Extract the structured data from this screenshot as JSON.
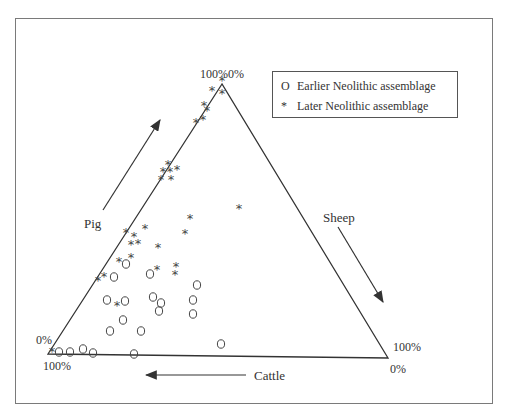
{
  "chart_data": {
    "type": "ternary-scatter",
    "title": "",
    "axes": {
      "pig": {
        "label": "Pig",
        "direction": "up-left edge, arrow toward top vertex",
        "apex_label": "100%",
        "base_label": "0%"
      },
      "sheep": {
        "label": "Sheep",
        "direction": "right edge, arrow toward bottom-right",
        "apex_label": "0%",
        "base_label": "100%"
      },
      "cattle": {
        "label": "Cattle",
        "direction": "bottom edge, arrow toward bottom-left",
        "left_label": "100%",
        "right_label": "0%"
      }
    },
    "corner_labels": {
      "top_left": "100%",
      "top_right": "0%",
      "bottom_left_upper": "0%",
      "bottom_left_lower": "100%",
      "bottom_right_upper": "100%",
      "bottom_right_lower": "0%"
    },
    "legend": [
      {
        "symbol": "O",
        "label": "Earlier Neolithic assemblage"
      },
      {
        "symbol": "*",
        "label": "Later Neolithic assemblage"
      }
    ],
    "series": [
      {
        "name": "Earlier Neolithic assemblage",
        "marker": "O",
        "points_px": [
          [
            59,
            352
          ],
          [
            70,
            352
          ],
          [
            83,
            349
          ],
          [
            93,
            353
          ],
          [
            134,
            354
          ],
          [
            221,
            344
          ],
          [
            114,
            277
          ],
          [
            126,
            264
          ],
          [
            150,
            274
          ],
          [
            197,
            285
          ],
          [
            193,
            300
          ],
          [
            193,
            314
          ],
          [
            107,
            300
          ],
          [
            125,
            301
          ],
          [
            153,
            297
          ],
          [
            161,
            303
          ],
          [
            159,
            311
          ],
          [
            123,
            320
          ],
          [
            110,
            331
          ],
          [
            141,
            331
          ]
        ]
      },
      {
        "name": "Later Neolithic assemblage",
        "marker": "*",
        "points_px": [
          [
            222,
            79
          ],
          [
            212,
            89
          ],
          [
            222,
            92
          ],
          [
            204,
            104
          ],
          [
            207,
            109
          ],
          [
            196,
            121
          ],
          [
            203,
            118
          ],
          [
            168,
            163
          ],
          [
            163,
            170
          ],
          [
            170,
            170
          ],
          [
            177,
            168
          ],
          [
            161,
            178
          ],
          [
            171,
            178
          ],
          [
            239,
            207
          ],
          [
            190,
            217
          ],
          [
            185,
            232
          ],
          [
            145,
            227
          ],
          [
            126,
            231
          ],
          [
            134,
            235
          ],
          [
            131,
            243
          ],
          [
            138,
            242
          ],
          [
            158,
            246
          ],
          [
            119,
            260
          ],
          [
            131,
            256
          ],
          [
            157,
            268
          ],
          [
            176,
            265
          ],
          [
            175,
            273
          ],
          [
            104,
            275
          ],
          [
            98,
            279
          ],
          [
            117,
            304
          ],
          [
            52,
            350
          ]
        ]
      }
    ]
  },
  "labels": {
    "pig": "Pig",
    "sheep": "Sheep",
    "cattle": "Cattle",
    "top_left_pct": "100%",
    "top_right_pct": "0%",
    "bl_upper_pct": "0%",
    "bl_lower_pct": "100%",
    "br_upper_pct": "100%",
    "br_lower_pct": "0%"
  },
  "legend": {
    "early_symbol": "O",
    "early_label": "Earlier Neolithic assemblage",
    "late_symbol": "*",
    "late_label": "Later Neolithic assemblage"
  },
  "colors": {
    "line": "#333333",
    "frame": "#7a7a7a",
    "marker": "#444444"
  }
}
